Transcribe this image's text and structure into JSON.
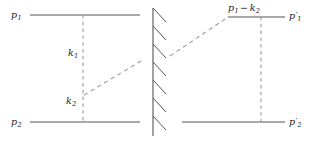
{
  "figure": {
    "type": "feynman-diagram",
    "title": "",
    "background_color": "#ffffff",
    "line_color": "#555555",
    "dash_color": "#9a9a9a",
    "text_color": "#1a1a1a",
    "width": 313,
    "height": 143
  },
  "left_diagram": {
    "name": "left-diagram",
    "labels": {
      "incoming_top": "p",
      "incoming_top_sub": "1",
      "incoming_bottom": "p",
      "incoming_bottom_sub": "2",
      "exchange_upper": "k",
      "exchange_upper_sub": "1",
      "exchange_lower": "k",
      "exchange_lower_sub": "2"
    },
    "elements": [
      {
        "name": "top-fermion-line",
        "kind": "solid-horizontal",
        "x1": 30,
        "y1": 15,
        "x2": 140,
        "y2": 15
      },
      {
        "name": "bottom-fermion-line",
        "kind": "solid-horizontal",
        "x1": 30,
        "y1": 122,
        "x2": 140,
        "y2": 122
      },
      {
        "name": "vertical-exchange-dashed-line",
        "kind": "dashed-vertical",
        "x1": 83,
        "y1": 15,
        "x2": 83,
        "y2": 122
      },
      {
        "name": "diagonal-exchange-dashed-line",
        "kind": "dashed-diagonal",
        "x1": 84,
        "y1": 95,
        "x2": 141,
        "y2": 61
      }
    ]
  },
  "barrier": {
    "name": "hatched-barrier",
    "kind": "hatched-vertical-wall",
    "x": 153,
    "y_top": 8,
    "y_bottom": 136,
    "hatch_count": 7,
    "hatch_direction": "down-right"
  },
  "right_diagram": {
    "name": "right-diagram",
    "labels": {
      "top_internal": "p",
      "top_internal_sub": "1",
      "top_internal_op": "−",
      "top_internal_second": "k",
      "top_internal_second_sub": "2",
      "outgoing_top": "p",
      "outgoing_top_sub": "1",
      "outgoing_top_prime": "′",
      "outgoing_bottom": "p",
      "outgoing_bottom_sub": "2",
      "outgoing_bottom_prime": "′"
    },
    "elements": [
      {
        "name": "top-fermion-line",
        "kind": "solid-horizontal",
        "x1": 228,
        "y1": 17,
        "x2": 285,
        "y2": 17
      },
      {
        "name": "bottom-fermion-line",
        "kind": "solid-horizontal",
        "x1": 182,
        "y1": 122,
        "x2": 285,
        "y2": 122
      },
      {
        "name": "vertical-exchange-dashed-line",
        "kind": "dashed-vertical",
        "x1": 261,
        "y1": 17,
        "x2": 261,
        "y2": 122
      },
      {
        "name": "incoming-diagonal-dashed-line",
        "kind": "dashed-diagonal",
        "x1": 170,
        "y1": 56,
        "x2": 228,
        "y2": 17
      }
    ]
  }
}
